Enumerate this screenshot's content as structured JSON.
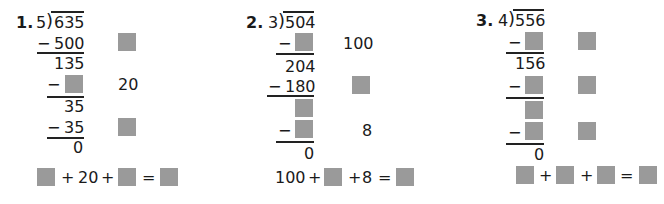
{
  "problems": [
    {
      "number": "1.",
      "divisor": "5",
      "dividend": "635",
      "steps": {
        "sub1": "500",
        "rem1": "135",
        "sub2": "",
        "rem2": "35",
        "sub3": "35",
        "final": "0"
      },
      "partial_quotients": [
        "",
        "20",
        ""
      ],
      "equation": {
        "terms": [
          "",
          "20",
          ""
        ],
        "result": ""
      }
    },
    {
      "number": "2.",
      "divisor": "3",
      "dividend": "504",
      "steps": {
        "sub1": "",
        "rem1": "204",
        "sub2": "180",
        "rem2": "",
        "sub3": "",
        "final": "0"
      },
      "partial_quotients": [
        "100",
        "",
        "8"
      ],
      "equation": {
        "terms": [
          "100",
          "",
          "8"
        ],
        "result": ""
      }
    },
    {
      "number": "3.",
      "divisor": "4",
      "dividend": "556",
      "steps": {
        "sub1": "",
        "rem1": "156",
        "sub2": "",
        "rem2": "",
        "sub3": "",
        "final": "0"
      },
      "partial_quotients": [
        "",
        "",
        ""
      ],
      "equation": {
        "terms": [
          "",
          "",
          ""
        ],
        "result": ""
      }
    }
  ],
  "symbols": {
    "minus": "−",
    "plus": "+",
    "equals": "=",
    "paren": ")"
  },
  "colors": {
    "answer_box": "#9a9a9a",
    "text": "#1a1a1a"
  }
}
